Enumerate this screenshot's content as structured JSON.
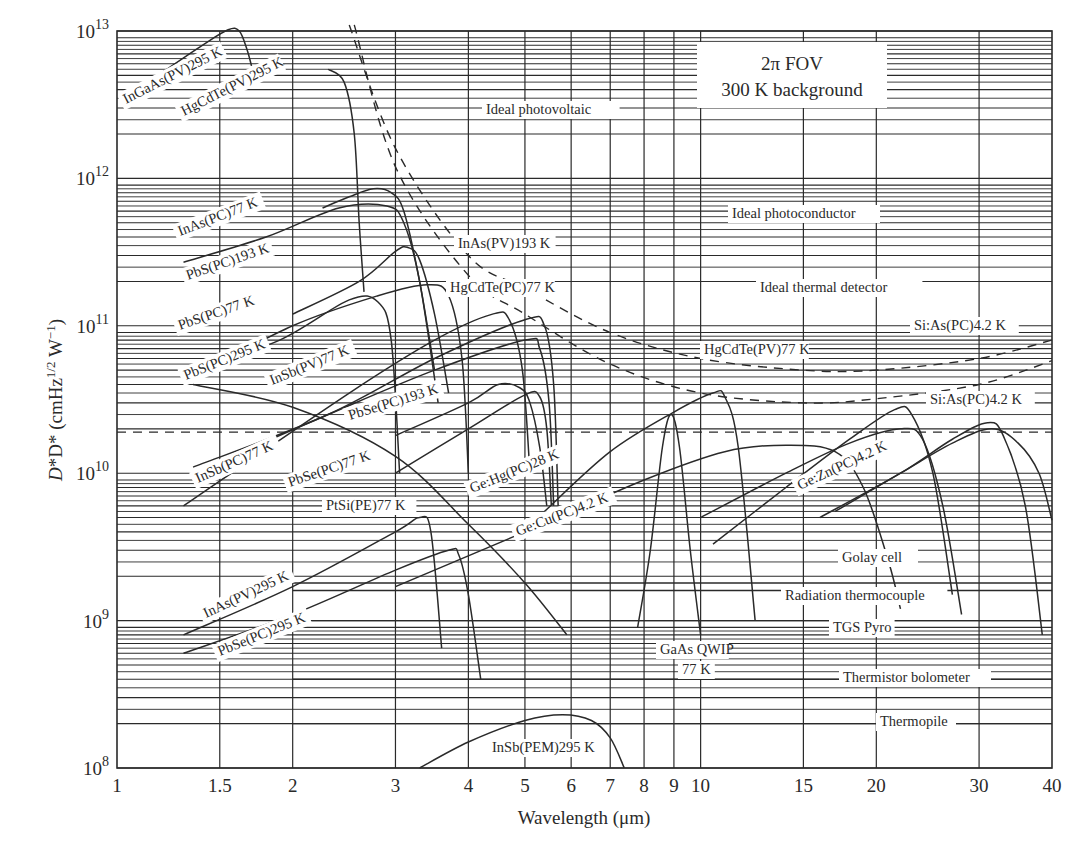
{
  "chart_data": {
    "type": "line",
    "title": "",
    "xlabel": "Wavelength (μm)",
    "ylabel": "D* (cmHz^1/2 W^-1)",
    "x_scale": "log",
    "y_scale": "log",
    "xlim": [
      1,
      40
    ],
    "ylim": [
      100000000.0,
      10500000000000.0
    ],
    "grid": true,
    "x_ticks": [
      1,
      1.5,
      2,
      3,
      4,
      5,
      6,
      7,
      8,
      9,
      10,
      15,
      20,
      30,
      40
    ],
    "x_tick_labels": [
      "1",
      "1.5",
      "2",
      "3",
      "4",
      "5",
      "6",
      "7",
      "8",
      "9",
      "10",
      "15",
      "20",
      "30",
      "40"
    ],
    "y_ticks": [
      100000000.0,
      1000000000.0,
      10000000000.0,
      100000000000.0,
      1000000000000.0,
      10000000000000.0
    ],
    "y_tick_labels": [
      {
        "base": "10",
        "exp": "8"
      },
      {
        "base": "10",
        "exp": "9"
      },
      {
        "base": "10",
        "exp": "10"
      },
      {
        "base": "10",
        "exp": "11"
      },
      {
        "base": "10",
        "exp": "12"
      },
      {
        "base": "10",
        "exp": "13"
      }
    ],
    "annotation_box": [
      "2π FOV",
      "300 K background"
    ],
    "series": [
      {
        "name": "InGaAs(PV)295 K",
        "style": "solid",
        "x": [
          1.2,
          1.4,
          1.55,
          1.62,
          1.67,
          1.7
        ],
        "y": [
          5300000000000.0,
          8000000000000.0,
          10200000000000.0,
          10000000000000.0,
          7500000000000.0,
          5800000000000.0
        ]
      },
      {
        "name": "HgCdTe(PV)295 K",
        "style": "solid",
        "x": [
          2.3,
          2.45,
          2.55,
          2.6,
          2.65
        ],
        "y": [
          5500000000000.0,
          4500000000000.0,
          2000000000000.0,
          500000000000.0,
          170000000000.0
        ]
      },
      {
        "name": "InAs(PC)77 K",
        "style": "solid",
        "x": [
          2.25,
          2.5,
          2.75,
          2.95,
          3.1,
          3.3,
          3.5
        ],
        "y": [
          630000000000.0,
          750000000000.0,
          850000000000.0,
          800000000000.0,
          600000000000.0,
          200000000000.0,
          50000000000.0
        ]
      },
      {
        "name": "PbS(PC)193 K",
        "style": "solid",
        "x": [
          1.3,
          1.8,
          2.4,
          2.9,
          3.1,
          3.3,
          3.55
        ],
        "y": [
          270000000000.0,
          400000000000.0,
          630000000000.0,
          650000000000.0,
          500000000000.0,
          200000000000.0,
          30000000000.0
        ]
      },
      {
        "name": "InAs(PV)193 K",
        "style": "solid",
        "x": [
          2.0,
          2.6,
          3.0,
          3.15,
          3.3,
          3.5,
          3.7
        ],
        "y": [
          120000000000.0,
          200000000000.0,
          320000000000.0,
          340000000000.0,
          280000000000.0,
          120000000000.0,
          35000000000.0
        ]
      },
      {
        "name": "PbS(PC)77 K",
        "style": "solid",
        "x": [
          1.35,
          2.0,
          2.8,
          3.4,
          3.7,
          3.9,
          4.0
        ],
        "y": [
          45000000000.0,
          100000000000.0,
          160000000000.0,
          190000000000.0,
          160000000000.0,
          60000000000.0,
          10000000000.0
        ]
      },
      {
        "name": "PbS(PC)295 K",
        "style": "solid",
        "x": [
          1.35,
          1.9,
          2.5,
          2.8,
          2.95,
          3.05
        ],
        "y": [
          50000000000.0,
          80000000000.0,
          150000000000.0,
          145000000000.0,
          80000000000.0,
          10000000000.0
        ]
      },
      {
        "name": "HgCdTe(PC)77 K",
        "style": "solid",
        "x": [
          1.3,
          2.5,
          3.5,
          4.4,
          4.7,
          4.95,
          5.1
        ],
        "y": [
          6000000000.0,
          35000000000.0,
          80000000000.0,
          120000000000.0,
          110000000000.0,
          50000000000.0,
          10000000000.0
        ]
      },
      {
        "name": "InSb(PV)77 K",
        "style": "solid",
        "x": [
          1.35,
          2.3,
          3.5,
          5.0,
          5.4,
          5.6,
          5.7
        ],
        "y": [
          11000000000.0,
          25000000000.0,
          60000000000.0,
          110000000000.0,
          100000000000.0,
          40000000000.0,
          6000000000.0
        ]
      },
      {
        "name": "InSb(PC)77 K",
        "style": "solid",
        "x": [
          1.35,
          2.3,
          3.5,
          5.0,
          5.3,
          5.5,
          5.6
        ],
        "y": [
          10000000000.0,
          25000000000.0,
          50000000000.0,
          80000000000.0,
          70000000000.0,
          30000000000.0,
          6000000000.0
        ]
      },
      {
        "name": "PbSe(PC)193 K",
        "style": "solid",
        "x": [
          3.0,
          4.0,
          4.5,
          4.9,
          5.1,
          5.3,
          5.45
        ],
        "y": [
          18000000000.0,
          30000000000.0,
          40000000000.0,
          38000000000.0,
          30000000000.0,
          15000000000.0,
          6000000000.0
        ]
      },
      {
        "name": "PbSe(PC)77 K",
        "style": "solid",
        "x": [
          3.0,
          4.0,
          5.0,
          5.3,
          5.45,
          5.55
        ],
        "y": [
          10000000000.0,
          20000000000.0,
          34000000000.0,
          33000000000.0,
          20000000000.0,
          6000000000.0
        ]
      },
      {
        "name": "PtSi(PE)77 K",
        "style": "solid",
        "x": [
          1.35,
          2.0,
          3.0,
          4.0,
          5.0,
          5.9
        ],
        "y": [
          40000000000.0,
          28000000000.0,
          13000000000.0,
          4500000000.0,
          1800000000.0,
          800000000.0
        ]
      },
      {
        "name": "InAs(PV)295 K",
        "style": "solid",
        "x": [
          1.3,
          2.0,
          3.0,
          3.3,
          3.45,
          3.6
        ],
        "y": [
          800000000.0,
          1700000000.0,
          4000000000.0,
          5000000000.0,
          4000000000.0,
          650000000.0
        ]
      },
      {
        "name": "PbSe(PC)295 K",
        "style": "solid",
        "x": [
          1.3,
          2.0,
          3.0,
          3.7,
          3.85,
          4.0,
          4.2
        ],
        "y": [
          600000000.0,
          1100000000.0,
          2200000000.0,
          3000000000.0,
          2800000000.0,
          1500000000.0,
          400000000.0
        ]
      },
      {
        "name": "Ge:Hg(PC)28 K",
        "style": "solid",
        "x": [
          5.4,
          7.0,
          9.0,
          10.5,
          11.0,
          11.6,
          12.4
        ],
        "y": [
          5500000000.0,
          14000000000.0,
          26000000000.0,
          35000000000.0,
          33000000000.0,
          15000000000.0,
          1000000000.0
        ]
      },
      {
        "name": "Ge:Cu(PC)4.2 K",
        "style": "solid",
        "x": [
          3.0,
          5.0,
          8.0,
          11.0,
          14.0,
          17.0,
          19.0,
          21.0,
          22.0
        ],
        "y": [
          1700000000.0,
          4000000000.0,
          9000000000.0,
          14000000000.0,
          15500000000.0,
          14000000000.0,
          8000000000.0,
          2500000000.0,
          1200000000.0
        ]
      },
      {
        "name": "GaAs QWIP 77 K",
        "style": "solid",
        "x": [
          7.8,
          8.2,
          8.6,
          8.9,
          9.2,
          9.6,
          10.0
        ],
        "y": [
          900000000.0,
          3000000000.0,
          15000000000.0,
          25000000000.0,
          15000000000.0,
          3000000000.0,
          800000000.0
        ]
      },
      {
        "name": "Ge:Zn(PC)4.2 K",
        "style": "solid",
        "x": [
          10.0,
          14.0,
          18.0,
          22.0,
          24.0,
          26.0,
          28.0
        ],
        "y": [
          5000000000.0,
          10000000000.0,
          16000000000.0,
          20000000000.0,
          17000000000.0,
          6000000000.0,
          1100000000.0
        ]
      },
      {
        "name": "Si:As(PC)4.2 K (upper)",
        "style": "solid",
        "x": [
          10.5,
          14.0,
          18.0,
          21.5,
          23.0,
          25.0,
          27.0
        ],
        "y": [
          3300000000.0,
          8000000000.0,
          17000000000.0,
          27000000000.0,
          25000000000.0,
          10000000000.0,
          1500000000.0
        ]
      },
      {
        "name": "Si:As(PC)4.2 K (lower)",
        "style": "solid",
        "x": [
          16.0,
          22.0,
          27.0,
          31.0,
          33.0,
          36.0,
          38.5
        ],
        "y": [
          5000000000.0,
          10000000000.0,
          17000000000.0,
          22000000000.0,
          18000000000.0,
          6000000000.0,
          800000000.0
        ]
      },
      {
        "name": "Si:As(PC)4.2 K (third)",
        "style": "solid",
        "x": [
          17.0,
          22.0,
          27.0,
          31.5,
          35.0,
          38.0,
          40.0
        ],
        "y": [
          5500000000.0,
          10000000000.0,
          16000000000.0,
          20000000000.0,
          16000000000.0,
          10000000000.0,
          4800000000.0
        ]
      },
      {
        "name": "InSb(PEM)295 K",
        "style": "solid",
        "x": [
          3.3,
          4.0,
          5.0,
          5.8,
          6.5,
          7.0,
          7.4
        ],
        "y": [
          100000000.0,
          150000000.0,
          210000000.0,
          230000000.0,
          210000000.0,
          160000000.0,
          100000000.0
        ]
      },
      {
        "name": "Ideal photovoltaic",
        "style": "dashed",
        "x": [
          2.5,
          3.0,
          4.0,
          5.0,
          7.0,
          10.0,
          15.0,
          20.0,
          30.0,
          40.0
        ],
        "y": [
          11000000000000.0,
          1600000000000.0,
          300000000000.0,
          180000000000.0,
          90000000000.0,
          60000000000.0,
          50000000000.0,
          50000000000.0,
          60000000000.0,
          80000000000.0
        ]
      },
      {
        "name": "Ideal photoconductor",
        "style": "dashed",
        "x": [
          2.55,
          3.0,
          4.0,
          5.0,
          7.0,
          10.0,
          15.0,
          20.0,
          30.0,
          40.0
        ],
        "y": [
          11000000000000.0,
          1200000000000.0,
          220000000000.0,
          120000000000.0,
          55000000000.0,
          35000000000.0,
          30000000000.0,
          32000000000.0,
          40000000000.0,
          58000000000.0
        ]
      },
      {
        "name": "Ideal thermal detector",
        "style": "dashed",
        "x": [
          1.0,
          40.0
        ],
        "y": [
          19000000000.0,
          19000000000.0
        ]
      }
    ],
    "thermal_detectors": [
      {
        "name": "Golay cell",
        "value": 1800000000.0
      },
      {
        "name": "Radiation thermocouple",
        "value": 1600000000.0
      },
      {
        "name": "TGS Pyro",
        "value": 1000000000.0
      },
      {
        "name": "Thermistor bolometer",
        "value": 400000000.0
      },
      {
        "name": "Thermopile",
        "value": 200000000.0
      }
    ]
  },
  "labels": {
    "xlabel": "Wavelength (μm)",
    "ylabel_main": "D* (cmHz",
    "ylabel_sup": "1/2",
    "ylabel_mid": " W",
    "ylabel_sup2": "−1",
    "ylabel_end": ")",
    "box_line1": "2π FOV",
    "box_line2": "300 K background"
  }
}
